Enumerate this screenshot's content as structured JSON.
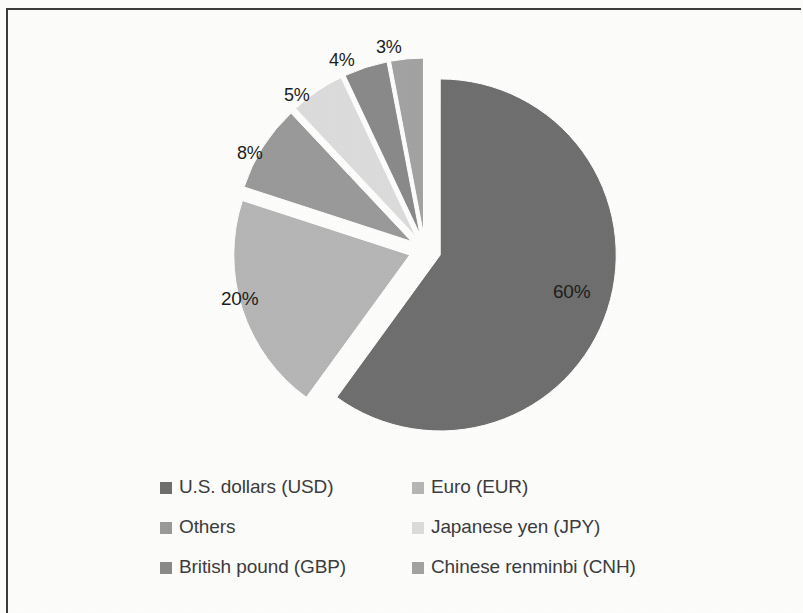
{
  "figure": {
    "background_color": "#fdfdfc",
    "frame_color": "#3b3b3b"
  },
  "chart_data": {
    "type": "pie",
    "title": "",
    "subtitle": "",
    "xlabel": "",
    "ylabel": "",
    "exploded": true,
    "grid": false,
    "legend_position": "bottom",
    "legend_columns": 2,
    "categories": [
      "U.S. dollars (USD)",
      "Euro (EUR)",
      "Others",
      "Japanese yen (JPY)",
      "British pound (GBP)",
      "Chinese renminbi (CNH)"
    ],
    "values": [
      60,
      20,
      8,
      5,
      4,
      3
    ],
    "data_labels": [
      "60%",
      "20%",
      "8%",
      "5%",
      "4%",
      "3%"
    ],
    "colors": [
      "#6f6f6f",
      "#b6b6b6",
      "#9a9a9a",
      "#dcdcdc",
      "#8a8a8a",
      "#a3a3a3"
    ],
    "units": "percent"
  },
  "slices": [
    {
      "name": "U.S. dollars (USD)",
      "label": "60%",
      "value": 60,
      "color": "#6f6f6f",
      "label_x": 553,
      "label_y": 281
    },
    {
      "name": "Euro (EUR)",
      "label": "20%",
      "value": 20,
      "color": "#b6b6b6",
      "label_x": 221,
      "label_y": 288
    },
    {
      "name": "Others",
      "label": "8%",
      "value": 8,
      "color": "#9a9a9a",
      "label_x": 237,
      "label_y": 143
    },
    {
      "name": "Japanese yen (JPY)",
      "label": "5%",
      "value": 5,
      "color": "#dcdcdc",
      "label_x": 284,
      "label_y": 85
    },
    {
      "name": "British pound (GBP)",
      "label": "4%",
      "value": 4,
      "color": "#8a8a8a",
      "label_x": 329,
      "label_y": 50
    },
    {
      "name": "Chinese renminbi (CNH)",
      "label": "3%",
      "value": 3,
      "color": "#a3a3a3",
      "label_x": 376,
      "label_y": 37
    }
  ],
  "legend": {
    "rows": [
      {
        "col1": {
          "label": "U.S. dollars (USD)",
          "color": "#6f6f6f"
        },
        "col2": {
          "label": "Euro (EUR)",
          "color": "#b6b6b6"
        }
      },
      {
        "col1": {
          "label": "Others",
          "color": "#9a9a9a"
        },
        "col2": {
          "label": "Japanese yen (JPY)",
          "color": "#dcdcdc"
        }
      },
      {
        "col1": {
          "label": "British pound (GBP)",
          "color": "#8a8a8a"
        },
        "col2": {
          "label": "Chinese renminbi (CNH)",
          "color": "#a3a3a3"
        }
      }
    ]
  }
}
